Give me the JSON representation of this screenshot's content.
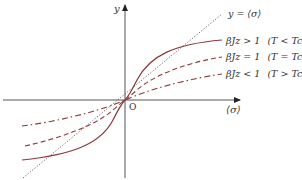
{
  "diagram": {
    "type": "magnetization-mean-field-graph",
    "axes": {
      "x_label": "⟨σ⟩",
      "y_label": "y",
      "origin_label": "O"
    },
    "reference_line": {
      "label": "y = ⟨σ⟩",
      "style": "dotted",
      "color": "#555555"
    },
    "curves": [
      {
        "id": "below-tc",
        "label": "βJz > 1  (T < T_c)",
        "label_main": "βJz > 1",
        "label_cond": "(T < Tc)",
        "style": "solid",
        "color": "#8b3a3a"
      },
      {
        "id": "at-tc",
        "label": "βJz = 1  (T = T_c)",
        "label_main": "βJz = 1",
        "label_cond": "(T = Tc)",
        "style": "dashed",
        "color": "#8b3a3a"
      },
      {
        "id": "above-tc",
        "label": "βJz < 1  (T > T_c)",
        "label_main": "βJz < 1",
        "label_cond": "(T > Tc)",
        "style": "dash-dot",
        "color": "#8b3a3a"
      }
    ],
    "colors": {
      "axis": "#333333",
      "curve": "#8b3a3a",
      "reference": "#555555",
      "text": "#333333"
    }
  }
}
